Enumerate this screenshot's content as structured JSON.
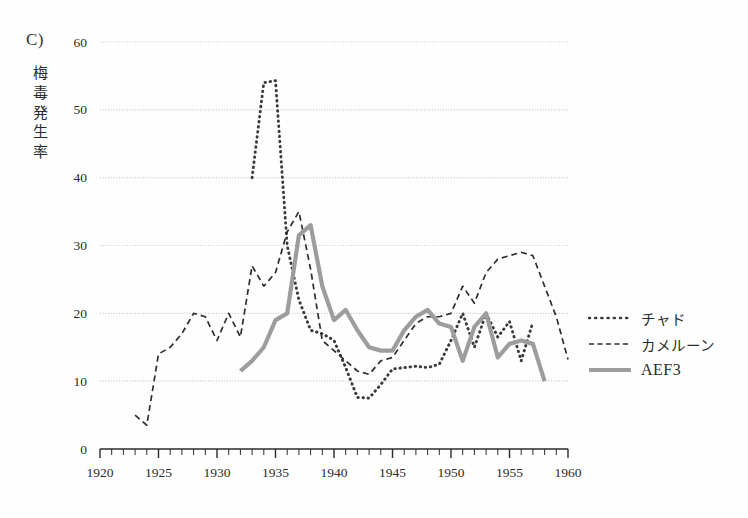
{
  "panel": {
    "label": "C)"
  },
  "axis_title": {
    "y_text": "梅毒発生率",
    "y_chars": [
      "梅",
      "毒",
      "発",
      "生",
      "率"
    ]
  },
  "legend": {
    "position": "right",
    "items": [
      {
        "label": "チャド",
        "style": "dotted",
        "color": "#3a3a3a",
        "script": "jp"
      },
      {
        "label": "カメルーン",
        "style": "dashed",
        "color": "#2e2e2e",
        "script": "jp"
      },
      {
        "label": "AEF3",
        "style": "solid",
        "color": "#9d9d9d",
        "script": "latin"
      }
    ]
  },
  "colors": {
    "chad": "#3a3a3a",
    "cameroun": "#2e2e2e",
    "aef3": "#9d9d9d",
    "gridline": "#c9c9c9",
    "axis": "#2b2b2b",
    "background": "#fefefe"
  },
  "chart_data": {
    "type": "line",
    "title": "",
    "xlabel": "",
    "ylabel": "梅毒発生率",
    "xlim": [
      1920,
      1960
    ],
    "ylim": [
      0,
      60
    ],
    "xticks": [
      1920,
      1925,
      1930,
      1935,
      1940,
      1945,
      1950,
      1955,
      1960
    ],
    "xtick_labels": [
      "1920",
      "1925",
      "1930",
      "1935",
      "1940",
      "1945",
      "1950",
      "1955",
      "1960"
    ],
    "x_minor_tick_step": 1,
    "yticks": [
      0,
      10,
      20,
      30,
      40,
      50,
      60
    ],
    "ytick_labels": [
      "0",
      "10",
      "20",
      "30",
      "40",
      "50",
      "60"
    ],
    "grid": "horizontal",
    "legend_position": "right",
    "series": [
      {
        "name": "チャド",
        "name_en": "Chad",
        "style": "dotted",
        "color": "#3a3a3a",
        "x": [
          1933,
          1934,
          1935,
          1936,
          1937,
          1938,
          1939,
          1940,
          1941,
          1942,
          1943,
          1944,
          1945,
          1946,
          1947,
          1948,
          1949,
          1950,
          1951,
          1952,
          1953,
          1954,
          1955,
          1956,
          1957
        ],
        "values": [
          40.0,
          54.0,
          54.3,
          30.0,
          22.0,
          17.5,
          17.0,
          16.0,
          12.0,
          7.6,
          7.5,
          9.5,
          11.8,
          12.0,
          12.2,
          12.0,
          12.5,
          16.0,
          20.0,
          15.0,
          20.0,
          16.5,
          18.8,
          13.0,
          18.7
        ]
      },
      {
        "name": "カメルーン",
        "name_en": "Cameroun",
        "style": "dashed",
        "color": "#2e2e2e",
        "x": [
          1923,
          1924,
          1925,
          1926,
          1927,
          1928,
          1929,
          1930,
          1931,
          1932,
          1933,
          1934,
          1935,
          1936,
          1937,
          1938,
          1939,
          1940,
          1941,
          1942,
          1943,
          1944,
          1945,
          1946,
          1947,
          1948,
          1949,
          1950,
          1951,
          1952,
          1953,
          1954,
          1955,
          1956,
          1957,
          1958,
          1959,
          1960
        ],
        "values": [
          5.0,
          3.5,
          14.0,
          15.0,
          17.0,
          20.0,
          19.5,
          16.0,
          20.0,
          16.5,
          27.0,
          24.0,
          26.0,
          32.0,
          35.0,
          26.5,
          16.0,
          14.5,
          13.0,
          11.5,
          11.0,
          13.0,
          13.5,
          16.0,
          18.5,
          19.5,
          19.5,
          20.0,
          24.0,
          21.5,
          26.0,
          28.0,
          28.5,
          29.0,
          28.5,
          24.0,
          19.5,
          13.2
        ]
      },
      {
        "name": "AEF3",
        "name_en": "AEF3",
        "style": "solid",
        "color": "#9d9d9d",
        "x": [
          1932,
          1933,
          1934,
          1935,
          1936,
          1937,
          1938,
          1939,
          1940,
          1941,
          1942,
          1943,
          1944,
          1945,
          1946,
          1947,
          1948,
          1949,
          1950,
          1951,
          1952,
          1953,
          1954,
          1955,
          1956,
          1957,
          1958
        ],
        "values": [
          11.5,
          13.0,
          15.0,
          19.0,
          20.0,
          31.5,
          33.0,
          24.0,
          19.0,
          20.5,
          17.5,
          15.0,
          14.5,
          14.5,
          17.5,
          19.5,
          20.5,
          18.5,
          18.0,
          13.0,
          18.0,
          20.0,
          13.5,
          15.5,
          16.0,
          15.5,
          10.0
        ]
      }
    ]
  }
}
